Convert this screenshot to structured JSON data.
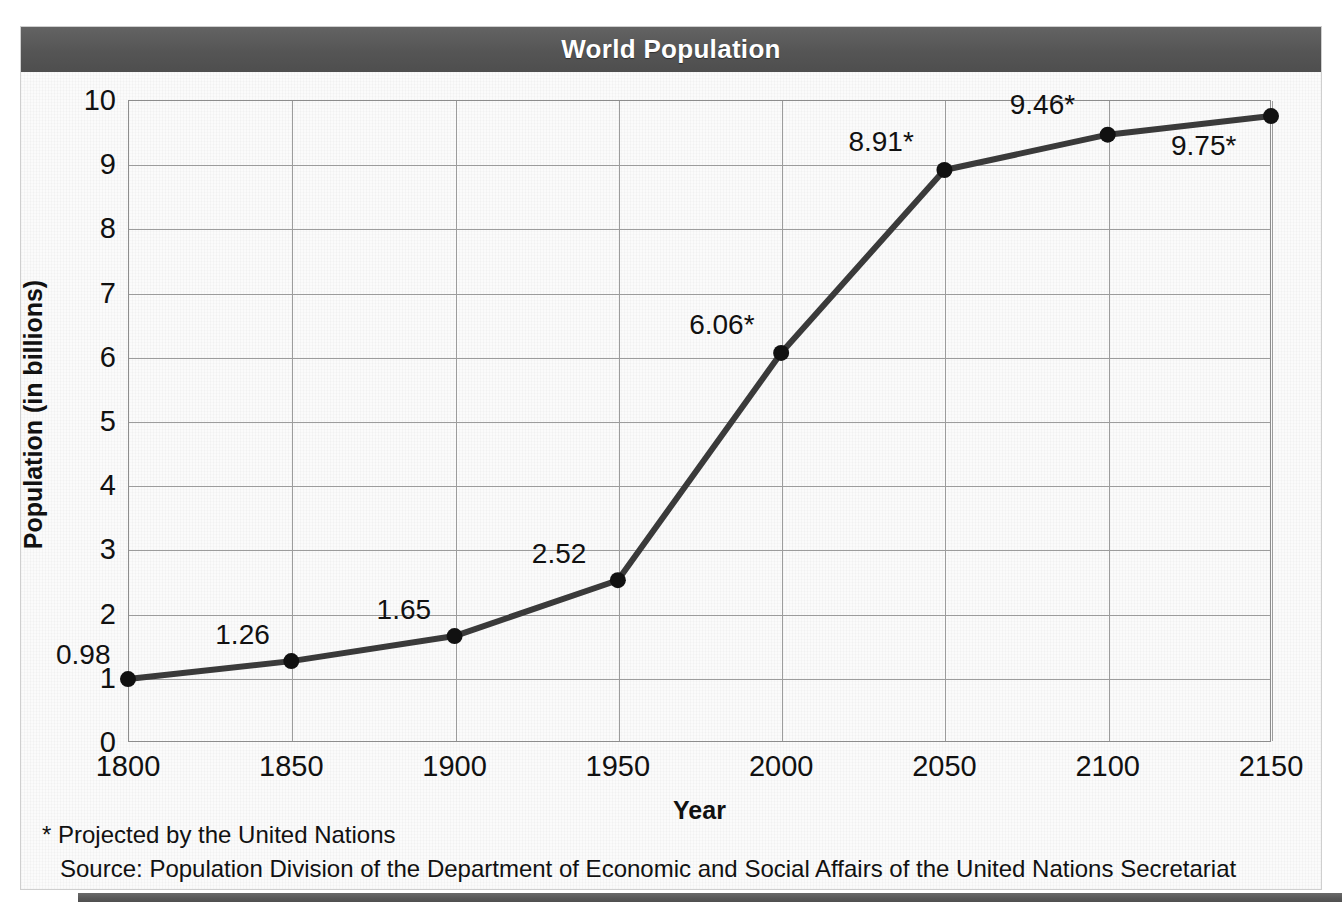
{
  "chart_data": {
    "type": "line",
    "title": "World Population",
    "xlabel": "Year",
    "ylabel": "Population (in billions)",
    "x": [
      1800,
      1850,
      1900,
      1950,
      2000,
      2050,
      2100,
      2150
    ],
    "values": [
      0.98,
      1.26,
      1.65,
      2.52,
      6.06,
      8.91,
      9.46,
      9.75
    ],
    "point_labels": [
      "0.98",
      "1.26",
      "1.65",
      "2.52",
      "6.06*",
      "8.91*",
      "9.46*",
      "9.75*"
    ],
    "projected": [
      false,
      false,
      false,
      false,
      true,
      true,
      true,
      true
    ],
    "xlim": [
      1800,
      2150
    ],
    "ylim": [
      0,
      10
    ],
    "x_ticks": [
      "1800",
      "1850",
      "1900",
      "1950",
      "2000",
      "2050",
      "2100",
      "2150"
    ],
    "y_ticks": [
      "10",
      "9",
      "8",
      "7",
      "6",
      "5",
      "4",
      "3",
      "2",
      "1",
      "0"
    ],
    "grid": true,
    "legend": "none",
    "line_color": "#3a3a3a",
    "marker_color": "#111111",
    "annotations": [
      "* Projected by the United Nations",
      "Source: Population Division of the Department of Economic and Social Affairs of the United Nations Secretariat"
    ]
  },
  "header": {
    "title": "World Population",
    "bar_color": "#555555",
    "text_color": "#ffffff"
  },
  "axes": {
    "y_title": "Population (in billions)",
    "x_title": "Year",
    "y_ticks": [
      "10",
      "9",
      "8",
      "7",
      "6",
      "5",
      "4",
      "3",
      "2",
      "1",
      "0"
    ],
    "x_ticks": [
      "1800",
      "1850",
      "1900",
      "1950",
      "2000",
      "2050",
      "2100",
      "2150"
    ]
  },
  "labels": {
    "p0": "0.98",
    "p1": "1.26",
    "p2": "1.65",
    "p3": "2.52",
    "p4": "6.06*",
    "p5": "8.91*",
    "p6": "9.46*",
    "p7": "9.75*"
  },
  "footnotes": {
    "projection_note": "* Projected by the United Nations",
    "source_note": "Source: Population Division of the Department of Economic and Social Affairs of the United Nations Secretariat"
  }
}
